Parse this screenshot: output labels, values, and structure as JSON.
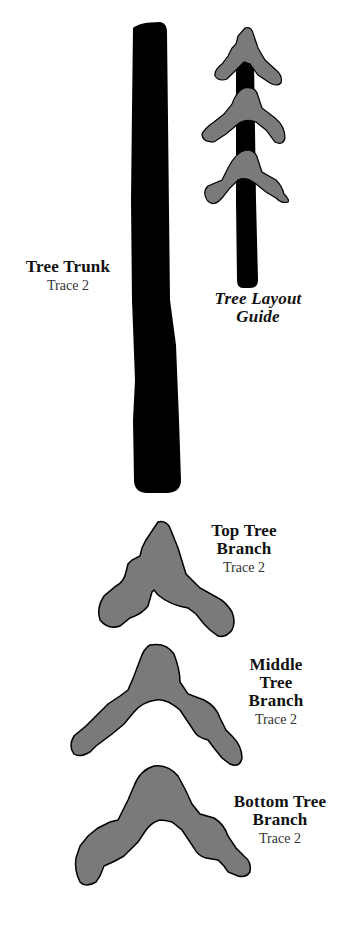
{
  "colors": {
    "trunk": "#000000",
    "branch_fill": "#7a7a7a",
    "branch_stroke": "#000000",
    "background": "#ffffff",
    "text": "#111111"
  },
  "pieces": {
    "trunk": {
      "title": "Tree Trunk",
      "subtitle": "Trace 2"
    },
    "layout_guide": {
      "title_line1": "Tree Layout",
      "title_line2": "Guide"
    },
    "top_branch": {
      "title_line1": "Top Tree",
      "title_line2": "Branch",
      "subtitle": "Trace 2"
    },
    "middle_branch": {
      "title_line1": "Middle",
      "title_line2": "Tree",
      "title_line3": "Branch",
      "subtitle": "Trace 2"
    },
    "bottom_branch": {
      "title_line1": "Bottom Tree",
      "title_line2": "Branch",
      "subtitle": "Trace 2"
    }
  }
}
